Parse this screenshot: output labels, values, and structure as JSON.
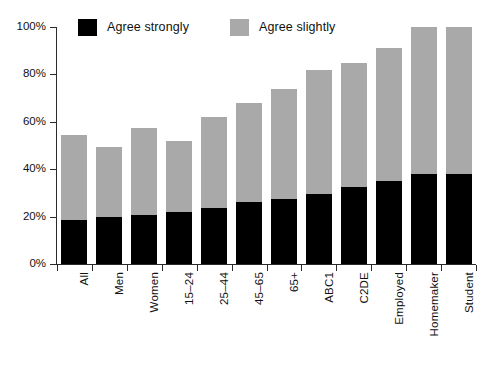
{
  "chart_data": {
    "type": "bar",
    "subtype": "stacked-bar",
    "title": "",
    "subtitle": "",
    "xlabel": "",
    "ylabel": "",
    "ylim": [
      0,
      100
    ],
    "y_unit": "%",
    "grid": false,
    "legend_position": "top",
    "categories": [
      "All",
      "Men",
      "Women",
      "15–24",
      "25–44",
      "45–65",
      "65+",
      "ABC1",
      "C2DE",
      "Employed",
      "Homemaker",
      "Student"
    ],
    "yticks": [
      0,
      20,
      40,
      60,
      80,
      100
    ],
    "ytick_labels": [
      "0%",
      "20%",
      "40%",
      "60%",
      "80%",
      "100%"
    ],
    "series": [
      {
        "name": "Agree strongly",
        "color": "#000000",
        "values": [
          18.5,
          20.0,
          20.5,
          22.0,
          23.5,
          26.0,
          27.5,
          29.5,
          32.5,
          35.0,
          38.0,
          38.0
        ]
      },
      {
        "name": "Agree slightly",
        "color": "#a9a9a9",
        "values": [
          36.0,
          29.5,
          37.0,
          30.0,
          38.5,
          42.0,
          46.5,
          52.5,
          52.5,
          56.0,
          62.0,
          62.0
        ]
      }
    ],
    "totals": [
      54.5,
      49.5,
      57.5,
      52.0,
      62.0,
      68.0,
      74.0,
      82.0,
      85.0,
      91.0,
      100.0,
      100.0
    ]
  },
  "legend": {
    "entries": [
      {
        "label": "Agree strongly",
        "color": "#000000",
        "swatch_name": "legend-swatch-agree-strongly"
      },
      {
        "label": "Agree slightly",
        "color": "#a9a9a9",
        "swatch_name": "legend-swatch-agree-slightly"
      }
    ]
  },
  "axes": {
    "y_axis_name": "percentage-axis",
    "x_axis_name": "category-axis"
  }
}
